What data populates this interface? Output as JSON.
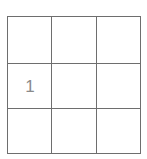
{
  "board": {
    "rows": 3,
    "cols": 3,
    "cells": [
      [
        "",
        "",
        ""
      ],
      [
        "1",
        "",
        ""
      ],
      [
        "",
        "",
        ""
      ]
    ],
    "line_color": "#6e6e6e",
    "text_color": "#8a8a8a"
  }
}
